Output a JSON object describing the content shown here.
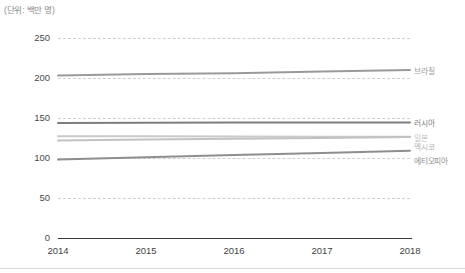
{
  "chart_data": {
    "type": "line",
    "title": "",
    "subtitle": "",
    "unit_label": "(단위: 백만 명)",
    "xlabel": "",
    "ylabel": "",
    "categories": [
      "2014",
      "2015",
      "2016",
      "2017",
      "2018"
    ],
    "x": [
      2014,
      2015,
      2016,
      2017,
      2018
    ],
    "ylim": [
      0,
      250
    ],
    "yticks": [
      0,
      50,
      100,
      150,
      200,
      250
    ],
    "grid": "horizontal-dashed",
    "legend_position": "right-inline-labels",
    "series": [
      {
        "name": "브라질",
        "values": [
          203,
          205,
          206,
          208,
          210
        ],
        "color": "#9a9a9a",
        "label_color": "#9a9a9a"
      },
      {
        "name": "러시아",
        "values": [
          143.8,
          144.1,
          144.3,
          144.5,
          144.5
        ],
        "color": "#7d7d7d",
        "label_color": "#7d7d7d"
      },
      {
        "name": "일본",
        "values": [
          127.3,
          127.1,
          126.9,
          126.7,
          126.5
        ],
        "color": "#cacaca",
        "label_color": "#bdbdbd"
      },
      {
        "name": "멕시코",
        "values": [
          122.0,
          123.0,
          124.0,
          125.0,
          126.2
        ],
        "color": "#c2c2c2",
        "label_color": "#b5b5b5"
      },
      {
        "name": "에티오피아",
        "values": [
          98.0,
          100.8,
          103.6,
          106.4,
          109.2
        ],
        "color": "#8e8e8e",
        "label_color": "#8e8e8e"
      }
    ]
  },
  "axis": {
    "baseline_color": "#3a3a3a",
    "gridline_color": "#cfcfcf",
    "tick_text_color": "#4a4a4a"
  }
}
